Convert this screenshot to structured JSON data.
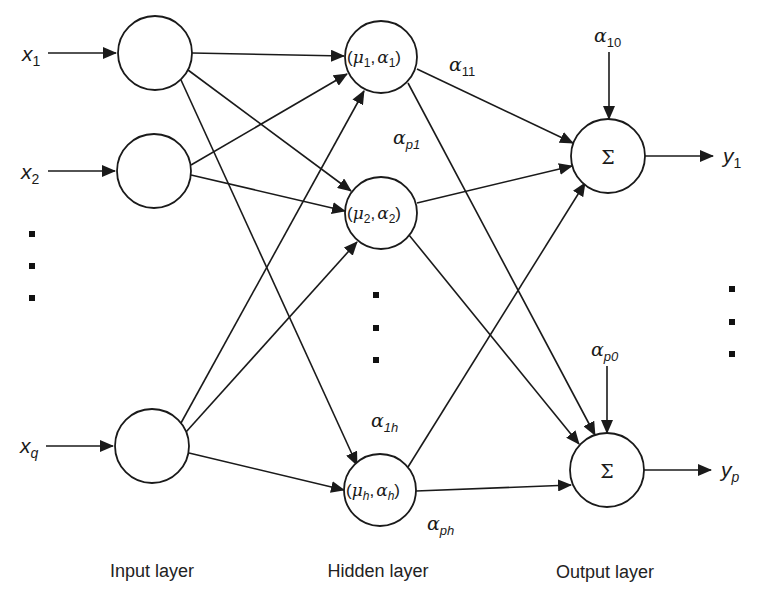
{
  "diagram": {
    "colors": {
      "stroke": "#1a1a1a",
      "background": "#ffffff"
    },
    "inputs": [
      {
        "var": "x",
        "sub": "1"
      },
      {
        "var": "x",
        "sub": "2"
      },
      {
        "var": "x",
        "sub": "q"
      }
    ],
    "hidden_nodes": [
      {
        "mu": "μ",
        "mu_sub": "1",
        "alpha": "α",
        "alpha_sub": "1"
      },
      {
        "mu": "μ",
        "mu_sub": "2",
        "alpha": "α",
        "alpha_sub": "2"
      },
      {
        "mu": "μ",
        "mu_sub": "h",
        "alpha": "α",
        "alpha_sub": "h"
      }
    ],
    "output_nodes": [
      {
        "symbol": "Σ",
        "bias": "α",
        "bias_sub": "10",
        "out_var": "y",
        "out_sub": "1"
      },
      {
        "symbol": "Σ",
        "bias": "α",
        "bias_sub": "p0",
        "out_var": "y",
        "out_sub": "p"
      }
    ],
    "weights": [
      {
        "sym": "α",
        "sub": "11"
      },
      {
        "sym": "α",
        "sub": "p1"
      },
      {
        "sym": "α",
        "sub": "1h"
      },
      {
        "sym": "α",
        "sub": "ph"
      }
    ],
    "layer_labels": {
      "input": "Input layer",
      "hidden": "Hidden layer",
      "output": "Output layer"
    },
    "punct": {
      "open": "(",
      "comma": ",",
      "close": ")"
    }
  }
}
